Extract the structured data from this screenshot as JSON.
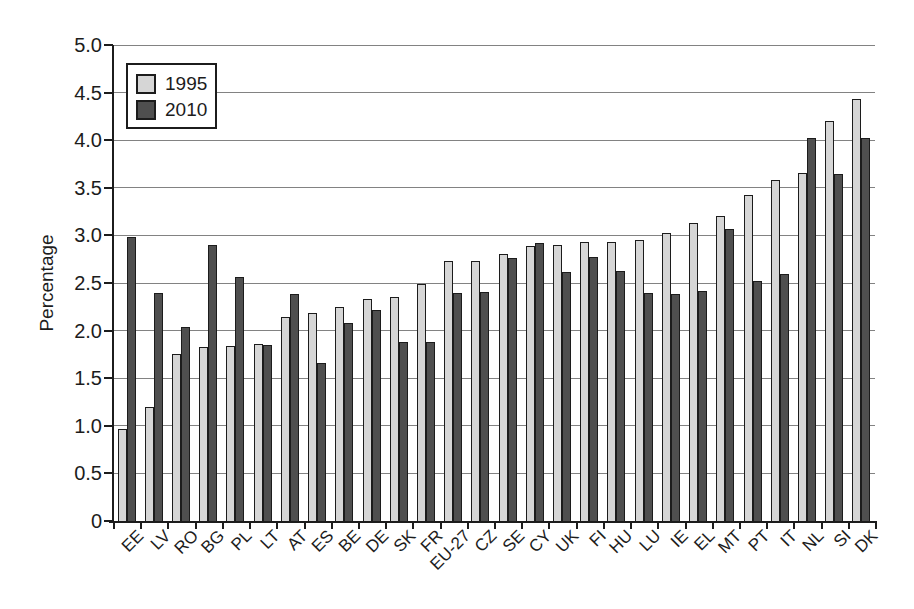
{
  "chart_data": {
    "type": "bar",
    "title": "",
    "ylabel": "Percentage",
    "xlabel": "",
    "ylim": [
      0,
      5.0
    ],
    "ytick_step": 0.5,
    "ytick_labels": [
      "0",
      "0.5",
      "1.0",
      "1.5",
      "2.0",
      "2.5",
      "3.0",
      "3.5",
      "4.0",
      "4.5",
      "5.0"
    ],
    "grid": true,
    "legend_position": "top-left",
    "categories": [
      "EE",
      "LV",
      "RO",
      "BG",
      "PL",
      "LT",
      "AT",
      "ES",
      "BE",
      "DE",
      "SK",
      "FR",
      "EU-27",
      "CZ",
      "SE",
      "CY",
      "UK",
      "FI",
      "HU",
      "LU",
      "IE",
      "EL",
      "MT",
      "PT",
      "IT",
      "NL",
      "SI",
      "DK"
    ],
    "series": [
      {
        "name": "1995",
        "color": "#d6d6d6",
        "values": [
          0.97,
          1.2,
          1.75,
          1.83,
          1.84,
          1.86,
          2.14,
          2.19,
          2.25,
          2.33,
          2.35,
          2.49,
          2.73,
          2.73,
          2.8,
          2.89,
          2.9,
          2.93,
          2.93,
          2.95,
          3.02,
          3.13,
          3.2,
          3.42,
          3.58,
          3.66,
          4.2,
          4.43
        ]
      },
      {
        "name": "2010",
        "color": "#4f4f4f",
        "values": [
          2.98,
          2.4,
          2.04,
          2.9,
          2.56,
          1.85,
          2.38,
          1.66,
          2.08,
          2.22,
          1.88,
          1.88,
          2.39,
          2.41,
          2.76,
          2.92,
          2.62,
          2.77,
          2.63,
          2.39,
          2.38,
          2.42,
          3.07,
          2.52,
          2.59,
          4.02,
          3.65,
          4.02
        ]
      }
    ]
  },
  "style": {
    "background": "#ffffff",
    "grid_color": "#828282",
    "axis_color": "#1c1c1c",
    "bar_border_color": "#1c1c1c",
    "text_color": "#1c1c1c",
    "legend_bg": "#ffffff",
    "legend_border": "#1c1c1c"
  }
}
